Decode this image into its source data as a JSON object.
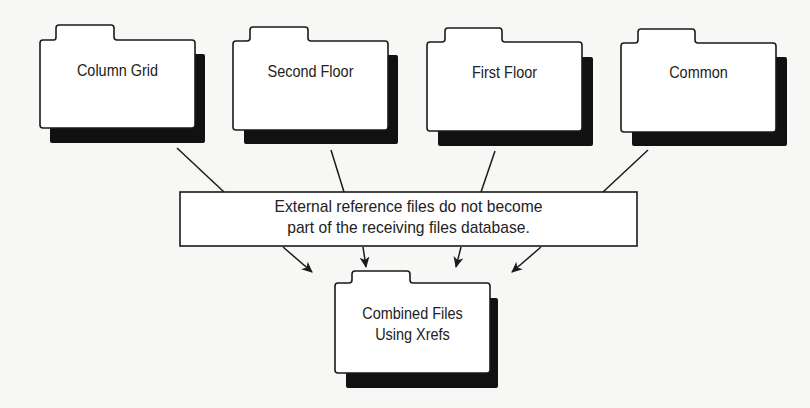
{
  "diagram": {
    "source_folders": [
      {
        "label": "Column Grid"
      },
      {
        "label": "Second Floor"
      },
      {
        "label": "First Floor"
      },
      {
        "label": "Common"
      }
    ],
    "callout": {
      "line1": "External reference files do not become",
      "line2": "part of the receiving files database."
    },
    "result_folder": {
      "line1": "Combined Files",
      "line2": "Using Xrefs"
    },
    "colors": {
      "stroke": "#1a1a1a",
      "shadow": "#111111",
      "fill": "#ffffff",
      "background": "#f7f7f5"
    }
  }
}
